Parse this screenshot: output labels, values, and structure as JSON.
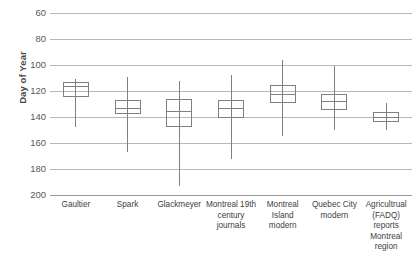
{
  "chart_data": {
    "type": "box",
    "title": "",
    "xlabel": "",
    "ylabel": "Day of Year",
    "ylim": [
      60,
      200
    ],
    "y_inverted": true,
    "grid": true,
    "legend": "none",
    "y_ticks": [
      60,
      80,
      100,
      120,
      140,
      160,
      180,
      200
    ],
    "categories": [
      "Gaultier",
      "Spark",
      "Glackmeyer",
      "Montreal 19th century journals",
      "Montreal Island modern",
      "Quebec City modern",
      "Agricultrual (FADQ) reports Montreal region"
    ],
    "boxes": [
      {
        "name": "Gaultier",
        "whisker_low": 111,
        "q1": 113,
        "median": 116,
        "q3": 125,
        "whisker_high": 148
      },
      {
        "name": "Spark",
        "whisker_low": 109,
        "q1": 127,
        "median": 133,
        "q3": 138,
        "whisker_high": 167
      },
      {
        "name": "Glackmeyer",
        "whisker_low": 112,
        "q1": 126,
        "median": 135,
        "q3": 148,
        "whisker_high": 193
      },
      {
        "name": "Montreal 19th century journals",
        "whisker_low": 108,
        "q1": 127,
        "median": 133,
        "q3": 141,
        "whisker_high": 172
      },
      {
        "name": "Montreal Island modern",
        "whisker_low": 96,
        "q1": 115,
        "median": 122,
        "q3": 129,
        "whisker_high": 155
      },
      {
        "name": "Quebec City modern",
        "whisker_low": 101,
        "q1": 122,
        "median": 128,
        "q3": 135,
        "whisker_high": 150
      },
      {
        "name": "Agricultrual (FADQ) reports Montreal region",
        "whisker_low": 129,
        "q1": 136,
        "median": 140,
        "q3": 144,
        "whisker_high": 150
      }
    ]
  },
  "axis": {
    "y_title": "Day of Year",
    "y_tick_labels": [
      "60",
      "80",
      "100",
      "120",
      "140",
      "160",
      "180",
      "200"
    ],
    "x_tick_labels": [
      "Gaultier",
      "Spark",
      "Glackmeyer",
      "Montreal 19th century journals",
      "Montreal Island modern",
      "Quebec City modern",
      "Agricultrual (FADQ) reports Montreal region"
    ]
  },
  "style": {
    "gridline_color": "#b8b8b8",
    "box_stroke_color": "#7f7f7f",
    "tick_label_color": "#595959",
    "axis_title_color": "#4a4a4a",
    "background": "#ffffff"
  }
}
